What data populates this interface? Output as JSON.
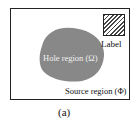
{
  "diagram": {
    "label": "Label",
    "hole_region": "Hole region (Ω)",
    "source_region": "Source region (Φ)",
    "caption": "(a)",
    "colors": {
      "hole_fill": "#888888",
      "frame": "#222222",
      "hatch": "#444444"
    }
  }
}
